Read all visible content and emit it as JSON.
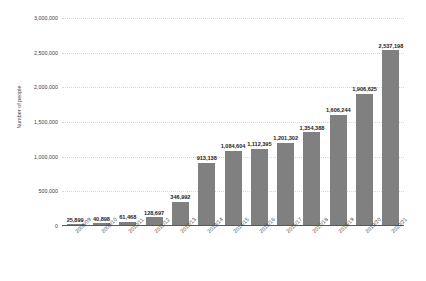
{
  "chart_data": {
    "type": "bar",
    "title": "",
    "subtitle": "",
    "xlabel": "",
    "ylabel": "Number of people",
    "ylim": [
      0,
      3000000
    ],
    "ytick_values": [
      0,
      500000,
      1000000,
      1500000,
      2000000,
      2500000,
      3000000
    ],
    "ytick_labels": [
      "0",
      "500,000",
      "1,000,000",
      "1,500,000",
      "2,000,000",
      "2,500,000",
      "3,000,000"
    ],
    "grid": true,
    "legend": null,
    "bar_color": "#808080",
    "background_color": "#ffffff",
    "categories": [
      "2008/09",
      "2009/10",
      "2010/11",
      "2011/12",
      "2012/13",
      "2013/14",
      "2014/15",
      "2015/16",
      "2016/17",
      "2017/18",
      "2018/19",
      "2019/20",
      "2020/21"
    ],
    "values": [
      25899,
      40898,
      61468,
      128697,
      346992,
      913138,
      1084604,
      1112395,
      1201302,
      1354388,
      1606244,
      1906625,
      2537198
    ],
    "value_labels": [
      "25,899",
      "40,898",
      "61,468",
      "128,697",
      "346,992",
      "913,138",
      "1,084,604",
      "1,112,395",
      "1,201,302",
      "1,354,388",
      "1,606,244",
      "1,906,625",
      "2,537,198"
    ]
  }
}
